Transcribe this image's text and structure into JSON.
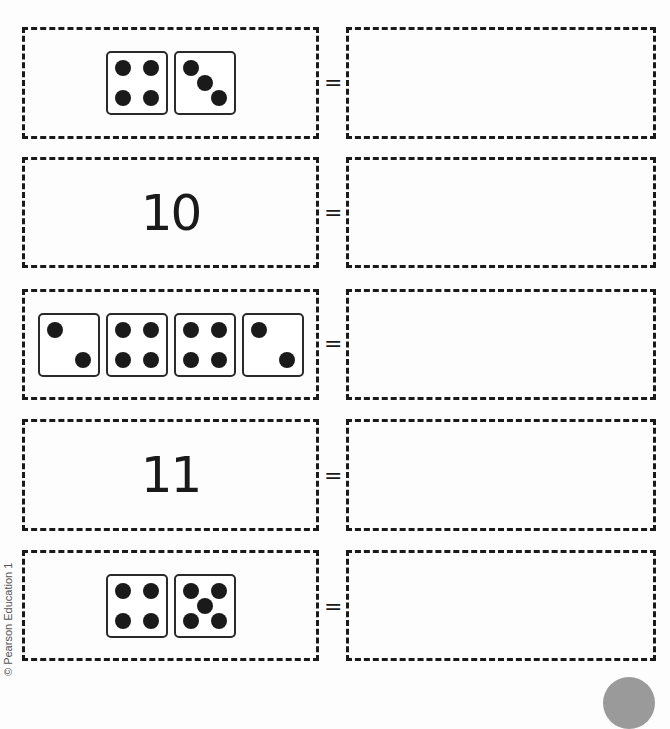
{
  "worksheet": {
    "equals_sign": "=",
    "rows": [
      {
        "type": "dice",
        "dice": [
          4,
          3
        ],
        "answer": ""
      },
      {
        "type": "number",
        "value": "10",
        "answer": ""
      },
      {
        "type": "dice",
        "dice": [
          2,
          4,
          4,
          2
        ],
        "answer": ""
      },
      {
        "type": "number",
        "value": "11",
        "answer": ""
      },
      {
        "type": "dice",
        "dice": [
          4,
          5
        ],
        "answer": ""
      }
    ]
  },
  "footer": {
    "copyright": "© Pearson Education 1"
  }
}
